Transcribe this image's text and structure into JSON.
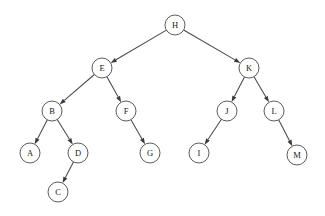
{
  "diagram": {
    "type": "binary-tree",
    "background_color": "#ffffff",
    "node_fill_color": "#ffffff",
    "node_stroke_color": "#4a4a4a",
    "edge_color": "#4a4a4a",
    "arrowhead_color": "#3a3a3a",
    "label_color": "#1a1a1a",
    "node_radius": 10,
    "root": "H",
    "nodes": [
      {
        "id": "H",
        "label": "H",
        "x": 175,
        "y": 25,
        "depth": 0
      },
      {
        "id": "E",
        "label": "E",
        "x": 102,
        "y": 68,
        "depth": 1
      },
      {
        "id": "K",
        "label": "K",
        "x": 249,
        "y": 68,
        "depth": 1
      },
      {
        "id": "B",
        "label": "B",
        "x": 52,
        "y": 111,
        "depth": 2
      },
      {
        "id": "F",
        "label": "F",
        "x": 126,
        "y": 111,
        "depth": 2
      },
      {
        "id": "J",
        "label": "J",
        "x": 227,
        "y": 111,
        "depth": 2
      },
      {
        "id": "L",
        "label": "L",
        "x": 274,
        "y": 111,
        "depth": 2
      },
      {
        "id": "A",
        "label": "A",
        "x": 30,
        "y": 153,
        "depth": 3
      },
      {
        "id": "D",
        "label": "D",
        "x": 78,
        "y": 153,
        "depth": 3
      },
      {
        "id": "G",
        "label": "G",
        "x": 150,
        "y": 153,
        "depth": 3
      },
      {
        "id": "I",
        "label": "I",
        "x": 199,
        "y": 153,
        "depth": 3
      },
      {
        "id": "M",
        "label": "M",
        "x": 297,
        "y": 155,
        "depth": 3
      },
      {
        "id": "C",
        "label": "C",
        "x": 58,
        "y": 192,
        "depth": 4
      }
    ],
    "edges": [
      {
        "from": "H",
        "to": "E",
        "side": "left"
      },
      {
        "from": "H",
        "to": "K",
        "side": "right"
      },
      {
        "from": "E",
        "to": "B",
        "side": "left"
      },
      {
        "from": "E",
        "to": "F",
        "side": "right"
      },
      {
        "from": "K",
        "to": "J",
        "side": "left"
      },
      {
        "from": "K",
        "to": "L",
        "side": "right"
      },
      {
        "from": "B",
        "to": "A",
        "side": "left"
      },
      {
        "from": "B",
        "to": "D",
        "side": "right"
      },
      {
        "from": "F",
        "to": "G",
        "side": "right"
      },
      {
        "from": "J",
        "to": "I",
        "side": "left"
      },
      {
        "from": "L",
        "to": "M",
        "side": "right"
      },
      {
        "from": "D",
        "to": "C",
        "side": "left"
      }
    ]
  }
}
